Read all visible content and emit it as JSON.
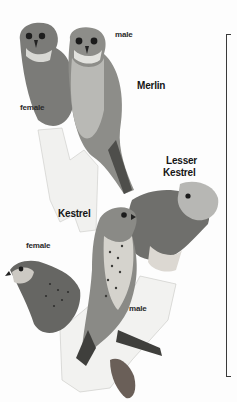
{
  "plate": {
    "labels": {
      "merlin_male": "male",
      "merlin_species": "Merlin",
      "merlin_female": "female",
      "lesser_kestrel_line1": "Lesser",
      "lesser_kestrel_line2": "Kestrel",
      "kestrel_species": "Kestrel",
      "kestrel_female": "female",
      "kestrel_male": "male"
    },
    "colors": {
      "background": "#fdfdfd",
      "label": "#151515",
      "bracket": "#3a3a3a"
    }
  }
}
